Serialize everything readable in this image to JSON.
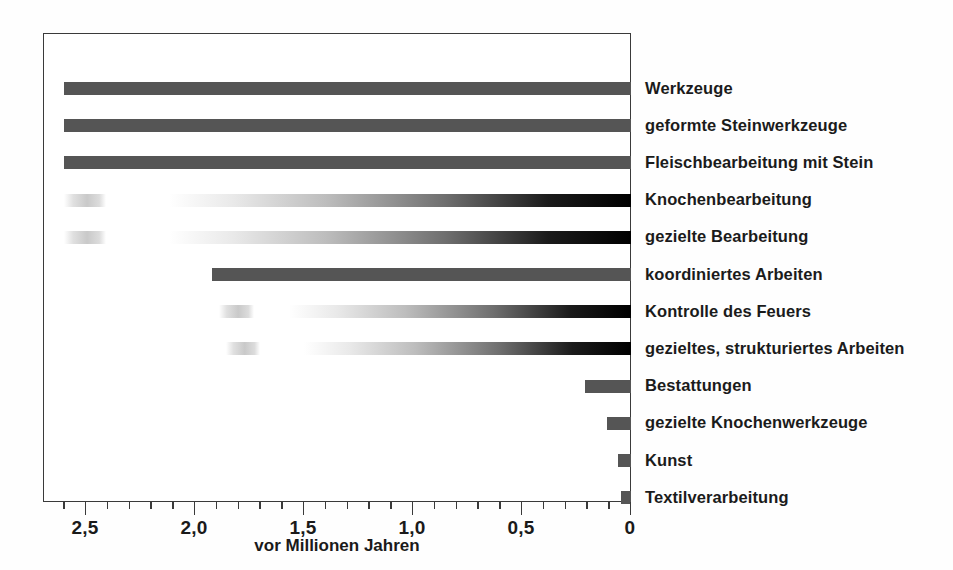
{
  "chart_data": {
    "type": "bar",
    "orientation": "horizontal",
    "title": "",
    "subtitle": "",
    "xlabel": "vor Millionen Jahren",
    "ylabel": "",
    "xlim": [
      2.7,
      0
    ],
    "x_axis_reversed": true,
    "grid": false,
    "legend": null,
    "x_major_ticks": [
      2.5,
      2.0,
      1.5,
      1.0,
      0.5,
      0
    ],
    "x_major_tick_labels": [
      "2,5",
      "2,0",
      "1,5",
      "1,0",
      "0,5",
      "0"
    ],
    "x_minor_tick_step": 0.1,
    "categories": [
      "Werkzeuge",
      "geformte Steinwerkzeuge",
      "Fleischbearbeitung mit Stein",
      "Knochenbearbeitung",
      "gezielte Bearbeitung",
      "koordiniertes Arbeiten",
      "Kontrolle des Feuers",
      "gezieltes, strukturiertes Arbeiten",
      "Bestattungen",
      "gezielte Knochenwerkzeuge",
      "Kunst",
      "Textilverarbeitung"
    ],
    "bars": [
      {
        "category": "Werkzeuge",
        "start_ma": 2.6,
        "end_ma": 0.0,
        "style": "solid",
        "ghost_segment": null
      },
      {
        "category": "geformte Steinwerkzeuge",
        "start_ma": 2.6,
        "end_ma": 0.0,
        "style": "solid",
        "ghost_segment": null
      },
      {
        "category": "Fleischbearbeitung mit Stein",
        "start_ma": 2.6,
        "end_ma": 0.0,
        "style": "solid",
        "ghost_segment": null
      },
      {
        "category": "Knochenbearbeitung",
        "start_ma": 2.12,
        "end_ma": 0.0,
        "style": "gradient",
        "ghost_segment": {
          "start_ma": 2.6,
          "end_ma": 2.41
        }
      },
      {
        "category": "gezielte Bearbeitung",
        "start_ma": 2.12,
        "end_ma": 0.0,
        "style": "gradient",
        "ghost_segment": {
          "start_ma": 2.6,
          "end_ma": 2.41
        }
      },
      {
        "category": "koordiniertes Arbeiten",
        "start_ma": 1.92,
        "end_ma": 0.0,
        "style": "solid",
        "ghost_segment": null
      },
      {
        "category": "Kontrolle des Feuers",
        "start_ma": 1.57,
        "end_ma": 0.0,
        "style": "gradient",
        "ghost_segment": {
          "start_ma": 1.89,
          "end_ma": 1.73
        }
      },
      {
        "category": "gezieltes, strukturiertes Arbeiten",
        "start_ma": 1.5,
        "end_ma": 0.0,
        "style": "gradient",
        "ghost_segment": {
          "start_ma": 1.86,
          "end_ma": 1.7
        }
      },
      {
        "category": "Bestattungen",
        "start_ma": 0.21,
        "end_ma": 0.0,
        "style": "solid",
        "ghost_segment": null
      },
      {
        "category": "gezielte Knochenwerkzeuge",
        "start_ma": 0.11,
        "end_ma": 0.0,
        "style": "solid",
        "ghost_segment": null
      },
      {
        "category": "Kunst",
        "start_ma": 0.06,
        "end_ma": 0.0,
        "style": "solid",
        "ghost_segment": null
      },
      {
        "category": "Textilverarbeitung",
        "start_ma": 0.045,
        "end_ma": 0.0,
        "style": "solid",
        "ghost_segment": null
      }
    ],
    "colors": {
      "solid_bar": "#555555",
      "gradient_bar_dark_end": "#000000",
      "gradient_bar_light_end": "#ffffff",
      "frame": "#3a3a3a",
      "text": "#1b1b1b",
      "background": "#ffffff"
    }
  },
  "axis": {
    "title": "vor Millionen Jahren",
    "tick_labels": [
      "2,5",
      "2,0",
      "1,5",
      "1,0",
      "0,5",
      "0"
    ]
  },
  "labels": [
    "Werkzeuge",
    "geformte Steinwerkzeuge",
    "Fleischbearbeitung mit Stein",
    "Knochenbearbeitung",
    "gezielte Bearbeitung",
    "koordiniertes Arbeiten",
    "Kontrolle des Feuers",
    "gezieltes, strukturiertes Arbeiten",
    "Bestattungen",
    "gezielte Knochenwerkzeuge",
    "Kunst",
    "Textilverarbeitung"
  ]
}
